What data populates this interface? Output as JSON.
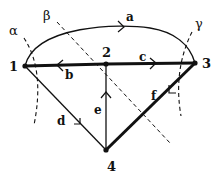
{
  "diagram": {
    "type": "graph-with-cuts",
    "colors": {
      "ink": "#111111",
      "background": "#ffffff"
    },
    "nodes": [
      {
        "id": "1",
        "label": "1",
        "x": 25,
        "y": 66
      },
      {
        "id": "2",
        "label": "2",
        "x": 106,
        "y": 64
      },
      {
        "id": "3",
        "label": "3",
        "x": 195,
        "y": 63
      },
      {
        "id": "4",
        "label": "4",
        "x": 106,
        "y": 150
      }
    ],
    "edges": [
      {
        "id": "a",
        "label": "a",
        "from": "1",
        "to": "3",
        "style": "thin-curved",
        "arrow_direction": "toward-3"
      },
      {
        "id": "b",
        "label": "b",
        "from": "2",
        "to": "1",
        "style": "thick",
        "arrow_direction": "toward-1"
      },
      {
        "id": "c",
        "label": "c",
        "from": "2",
        "to": "3",
        "style": "thick",
        "arrow_direction": "toward-3"
      },
      {
        "id": "d",
        "label": "d",
        "from": "1",
        "to": "4",
        "style": "thin",
        "arrow_direction": "toward-4"
      },
      {
        "id": "e",
        "label": "e",
        "from": "4",
        "to": "2",
        "style": "thin",
        "arrow_direction": "toward-2"
      },
      {
        "id": "f",
        "label": "f",
        "from": "4",
        "to": "3",
        "style": "thick",
        "arrow_direction": "toward-4"
      }
    ],
    "cuts": [
      {
        "id": "alpha",
        "label": "α",
        "style": "dashed-curve"
      },
      {
        "id": "beta",
        "label": "β",
        "style": "dashed-line"
      },
      {
        "id": "gamma",
        "label": "γ",
        "style": "dashed-curve"
      }
    ]
  }
}
